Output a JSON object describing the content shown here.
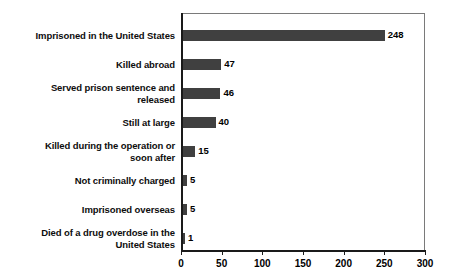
{
  "chart_data": {
    "type": "bar",
    "orientation": "horizontal",
    "title": "",
    "subtitle": "",
    "xlabel": "",
    "ylabel": "",
    "xlim": [
      0,
      300
    ],
    "xticks": [
      0,
      50,
      100,
      150,
      200,
      250,
      300
    ],
    "xtick_labels": [
      "0",
      "50",
      "100",
      "150",
      "200",
      "250",
      "300"
    ],
    "grid": false,
    "legend": false,
    "bar_color": "#404040",
    "axis_color": "#1a1a1a",
    "frame_color": "#7a7a7a",
    "categories": [
      "Imprisoned in the United States",
      "Killed abroad",
      "Served prison sentence and released",
      "Still at large",
      "Killed during the operation or soon after",
      "Not criminally charged",
      "Imprisoned overseas",
      "Died of a drug overdose in the United States"
    ],
    "category_lines": [
      [
        "Imprisoned in the United States"
      ],
      [
        "Killed abroad"
      ],
      [
        "Served prison sentence and",
        "released"
      ],
      [
        "Still at large"
      ],
      [
        "Killed during the operation or",
        "soon after"
      ],
      [
        "Not criminally charged"
      ],
      [
        "Imprisoned overseas"
      ],
      [
        "Died of a drug overdose in the",
        "United States"
      ]
    ],
    "values": [
      248,
      47,
      46,
      40,
      15,
      5,
      5,
      1
    ],
    "value_labels": [
      "248",
      "47",
      "46",
      "40",
      "15",
      "5",
      "5",
      "1"
    ]
  }
}
